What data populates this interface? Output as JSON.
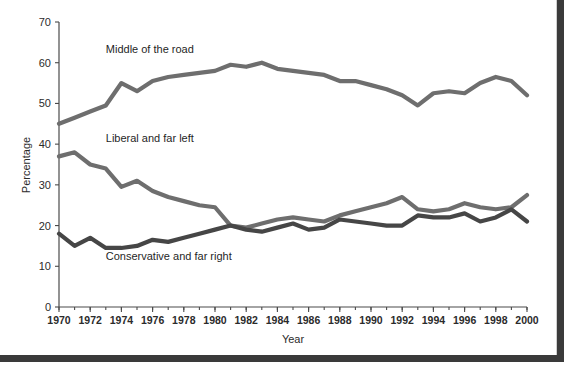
{
  "chart_data": {
    "type": "line",
    "title": "",
    "xlabel": "Year",
    "ylabel": "Percentage",
    "xlim": [
      1970,
      2000
    ],
    "ylim": [
      0,
      70
    ],
    "grid": false,
    "legend_position": "inline-annotations",
    "x": [
      1970,
      1971,
      1972,
      1973,
      1974,
      1975,
      1976,
      1977,
      1978,
      1979,
      1980,
      1981,
      1982,
      1983,
      1984,
      1985,
      1986,
      1987,
      1988,
      1989,
      1990,
      1991,
      1992,
      1993,
      1994,
      1995,
      1996,
      1997,
      1998,
      1999,
      2000
    ],
    "xtick_labels": [
      "1970",
      "1972",
      "1974",
      "1976",
      "1978",
      "1980",
      "1982",
      "1984",
      "1986",
      "1988",
      "1990",
      "1992",
      "1994",
      "1996",
      "1998",
      "2000"
    ],
    "xticks": [
      1970,
      1972,
      1974,
      1976,
      1978,
      1980,
      1982,
      1984,
      1986,
      1988,
      1990,
      1992,
      1994,
      1996,
      1998,
      2000
    ],
    "ytick_labels": [
      "0",
      "10",
      "20",
      "30",
      "40",
      "50",
      "60",
      "70"
    ],
    "yticks": [
      0,
      10,
      20,
      30,
      40,
      50,
      60,
      70
    ],
    "series": [
      {
        "name": "Middle of the road",
        "color": "#6e6e6e",
        "label_x": 1973.0,
        "label_y": 62.5,
        "values": [
          45.0,
          46.5,
          48.0,
          49.5,
          55.0,
          53.0,
          55.5,
          56.5,
          57.0,
          57.5,
          58.0,
          59.5,
          59.0,
          60.0,
          58.5,
          58.0,
          57.5,
          57.0,
          55.5,
          55.5,
          54.5,
          53.5,
          52.0,
          49.5,
          52.5,
          53.0,
          52.5,
          55.0,
          56.5,
          55.5,
          52.0
        ]
      },
      {
        "name": "Liberal and far left",
        "color": "#6e6e6e",
        "label_x": 1973.0,
        "label_y": 40.5,
        "values": [
          37.0,
          38.0,
          35.0,
          34.0,
          29.5,
          31.0,
          28.5,
          27.0,
          26.0,
          25.0,
          24.5,
          20.0,
          19.5,
          20.5,
          21.5,
          22.0,
          21.5,
          21.0,
          22.5,
          23.5,
          24.5,
          25.5,
          27.0,
          24.0,
          23.5,
          24.0,
          25.5,
          24.5,
          24.0,
          24.5,
          27.5
        ]
      },
      {
        "name": "Conservative and far right",
        "color": "#464646",
        "label_x": 1973.0,
        "label_y": 11.5,
        "values": [
          18.0,
          15.0,
          17.0,
          14.5,
          14.5,
          15.0,
          16.5,
          16.0,
          17.0,
          18.0,
          19.0,
          20.0,
          19.0,
          18.5,
          19.5,
          20.5,
          19.0,
          19.5,
          21.5,
          21.0,
          20.5,
          20.0,
          20.0,
          22.5,
          22.0,
          22.0,
          23.0,
          21.0,
          22.0,
          24.0,
          21.0
        ]
      }
    ]
  },
  "axis": {
    "y_title": "Percentage",
    "x_title": "Year"
  },
  "colors": {
    "frame": "#3a3a3a",
    "axis": "#4a4a4a",
    "text": "#2b2b2b",
    "middle_of_road": "#6e6e6e",
    "liberal": "#6e6e6e",
    "conservative": "#464646",
    "background": "#ffffff"
  }
}
